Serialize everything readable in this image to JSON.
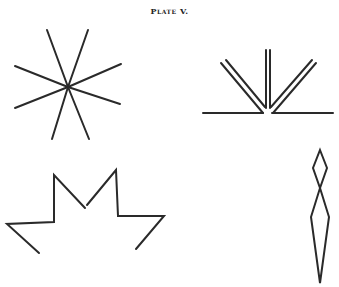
{
  "plate": {
    "title": "Plate V."
  },
  "figures": {
    "star": {
      "label": "eight-ray star",
      "center": [
        68,
        87
      ],
      "rays": [
        [
          47,
          30
        ],
        [
          88,
          30
        ],
        [
          15,
          66
        ],
        [
          121,
          64
        ],
        [
          15,
          108
        ],
        [
          120,
          104
        ],
        [
          52,
          139
        ],
        [
          89,
          139
        ]
      ]
    },
    "fan": {
      "label": "fan of double lines on baseline",
      "lines": [
        [
          203,
          113,
          263,
          113
        ],
        [
          272,
          113,
          333,
          113
        ],
        [
          266,
          50,
          266,
          108
        ],
        [
          270,
          50,
          270,
          108
        ],
        [
          221,
          63,
          263,
          113
        ],
        [
          226,
          60,
          265,
          107
        ],
        [
          316,
          63,
          273,
          113
        ],
        [
          312,
          60,
          271,
          107
        ]
      ]
    },
    "crown": {
      "label": "zigzag crown",
      "paths": [
        "39,253 7,224 54,222 54,175 85,208",
        "87,205 116,170 118,216 164,216 136,249"
      ]
    },
    "spindle": {
      "label": "diamond over elongated spindle",
      "diamond": "320,150 327,168 320,188 313,168",
      "body": "320,188 329,217 320,283 311,217"
    }
  },
  "colors": {
    "ink": "#2a2a2a",
    "paper": "#ffffff"
  }
}
